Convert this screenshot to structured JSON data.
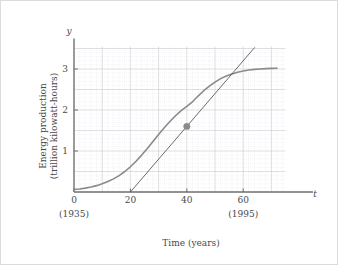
{
  "figure": {
    "background_color": "#ffffff",
    "border_color": "#dcdcdc"
  },
  "chart_data": {
    "type": "line",
    "title": "",
    "subtitle": "",
    "xlabel": "Time (years)",
    "ylabel": "Energy production (trillion kilowatt-hours)",
    "xlabel_text": "Time (years)",
    "ylabel_line1": "Energy production",
    "ylabel_line2": "(trillion kilowatt-hours)",
    "x_axis_variable": "t",
    "y_axis_variable": "y",
    "xlim": [
      0,
      75
    ],
    "ylim": [
      0,
      3.55
    ],
    "grid": true,
    "grid_major_color": "#c9c9c9",
    "grid_minor_color": "#d9d9e4",
    "grid_major_x_step": 10,
    "grid_major_y_step": 0.5,
    "grid_minor_x_step": 2,
    "grid_minor_y_step": 0.1,
    "legend": false,
    "legend_position": "none",
    "xticks": [
      0,
      20,
      40,
      60
    ],
    "xtick_labels": [
      "0",
      "20",
      "40",
      "60"
    ],
    "yticks": [
      1,
      2,
      3
    ],
    "ytick_labels": [
      "1",
      "2",
      "3"
    ],
    "x_secondary_labels": [
      {
        "x": 0,
        "label": "(1935)"
      },
      {
        "x": 60,
        "label": "(1995)"
      }
    ],
    "series": [
      {
        "name": "energy-production-curve",
        "type": "logistic",
        "color": "#8a8a8a",
        "linewidth": 1.6,
        "points": [
          [
            0,
            0.06
          ],
          [
            2,
            0.075
          ],
          [
            4,
            0.095
          ],
          [
            6,
            0.12
          ],
          [
            8,
            0.155
          ],
          [
            10,
            0.2
          ],
          [
            12,
            0.255
          ],
          [
            14,
            0.32
          ],
          [
            16,
            0.4
          ],
          [
            18,
            0.5
          ],
          [
            20,
            0.615
          ],
          [
            22,
            0.75
          ],
          [
            24,
            0.9
          ],
          [
            26,
            1.06
          ],
          [
            28,
            1.23
          ],
          [
            30,
            1.4
          ],
          [
            32,
            1.565
          ],
          [
            34,
            1.72
          ],
          [
            36,
            1.86
          ],
          [
            38,
            1.985
          ],
          [
            40,
            2.09
          ],
          [
            42,
            2.2
          ],
          [
            44,
            2.34
          ],
          [
            46,
            2.47
          ],
          [
            48,
            2.58
          ],
          [
            50,
            2.68
          ],
          [
            52,
            2.765
          ],
          [
            54,
            2.83
          ],
          [
            56,
            2.88
          ],
          [
            58,
            2.92
          ],
          [
            60,
            2.95
          ],
          [
            62,
            2.975
          ],
          [
            64,
            2.99
          ],
          [
            66,
            3.0
          ],
          [
            68,
            3.01
          ],
          [
            70,
            3.015
          ],
          [
            72,
            3.02
          ]
        ]
      },
      {
        "name": "tangent-line-at-inflection",
        "type": "line",
        "color": "#5a5a5a",
        "linewidth": 0.9,
        "points": [
          [
            20,
            0.0
          ],
          [
            64,
            3.52
          ]
        ],
        "note": "tangent drawn through inflection point"
      }
    ],
    "markers": [
      {
        "name": "inflection-point",
        "x": 40,
        "y": 1.6,
        "color": "#8a8a8a",
        "size": 3.2
      }
    ],
    "annotations": []
  }
}
